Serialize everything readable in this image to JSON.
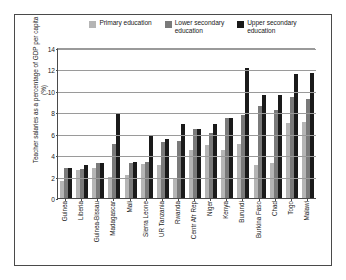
{
  "chart_data": {
    "type": "bar",
    "title": "",
    "xlabel": "",
    "ylabel": "Teacher salaries as a percentage of GDP per capita (%)",
    "ylim": [
      0,
      14
    ],
    "yticks": [
      0,
      2,
      4,
      6,
      8,
      10,
      12,
      14
    ],
    "grid": true,
    "legend_position": "top",
    "categories": [
      "Guinea",
      "Liberia",
      "Guinea-Bissau",
      "Madagascar",
      "Mali",
      "Sierra Leone",
      "UR Tanzania",
      "Rwanda",
      "Centr Afr Rep",
      "Niger",
      "Kenya",
      "Burundi",
      "Burkina Faso",
      "Chad",
      "Togo",
      "Malawi"
    ],
    "series": [
      {
        "name": "Primary education",
        "color": "#b5b5b5",
        "values": [
          1.7,
          2.7,
          2.9,
          2.1,
          2.2,
          3.3,
          3.2,
          2.0,
          4.6,
          5.0,
          4.6,
          5.1,
          3.2,
          3.4,
          7.1,
          7.2
        ]
      },
      {
        "name": "Lower secondary education",
        "color": "#7a7a7a",
        "values": [
          2.9,
          2.8,
          3.4,
          5.1,
          3.4,
          3.5,
          5.3,
          5.4,
          6.5,
          6.2,
          7.6,
          7.8,
          8.7,
          8.3,
          9.5,
          9.3
        ]
      },
      {
        "name": "Upper secondary education",
        "color": "#1a1a1a",
        "values": [
          2.9,
          3.2,
          3.4,
          8.0,
          3.5,
          5.9,
          5.6,
          7.0,
          6.5,
          7.0,
          7.6,
          12.2,
          9.7,
          9.7,
          11.7,
          11.8
        ]
      }
    ]
  },
  "legend": {
    "entries": [
      {
        "label": "Primary education",
        "color": "#b5b5b5"
      },
      {
        "label": "Lower secondary\neducation",
        "color": "#7a7a7a"
      },
      {
        "label": "Upper secondary\neducation",
        "color": "#1a1a1a"
      }
    ]
  }
}
